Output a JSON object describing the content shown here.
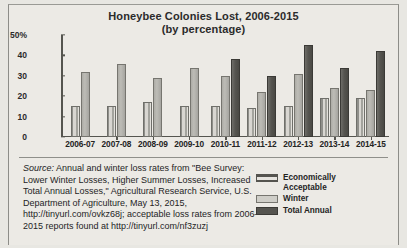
{
  "chart_data": {
    "type": "bar",
    "title": "Honeybee Colonies Lost, 2006-2015",
    "subtitle": "(by percentage)",
    "xlabel": "",
    "ylabel": "",
    "ylim": [
      0,
      50
    ],
    "yticks": [
      "50%",
      "40",
      "30",
      "20",
      "10",
      "0"
    ],
    "ytick_values": [
      50,
      40,
      30,
      20,
      10,
      0
    ],
    "grid": false,
    "legend_position": "bottom-right",
    "categories": [
      "2006-07",
      "2007-08",
      "2008-09",
      "2009-10",
      "2010-11",
      "2011-12",
      "2012-13",
      "2013-14",
      "2014-15"
    ],
    "series": [
      {
        "name": "Economically Acceptable",
        "color": "#55544f",
        "values": [
          15,
          15,
          17,
          15,
          15,
          14,
          15,
          19,
          19
        ]
      },
      {
        "name": "Winter",
        "color": "#cfcec8",
        "values": [
          32,
          36,
          29,
          34,
          30,
          22,
          31,
          24,
          23
        ]
      },
      {
        "name": "Total Annual",
        "color": "#55544f",
        "values": [
          null,
          null,
          null,
          null,
          38,
          30,
          45,
          34,
          42
        ]
      }
    ]
  },
  "legend": {
    "items": [
      {
        "label_line1": "Economically",
        "label_line2": "Acceptable",
        "swatch": "acceptable"
      },
      {
        "label_line1": "Winter",
        "label_line2": "",
        "swatch": "winter"
      },
      {
        "label_line1": "Total Annual",
        "label_line2": "",
        "swatch": "total"
      }
    ]
  },
  "caption": {
    "source_label": "Source:",
    "text": " Annual and winter loss rates from \"Bee Survey: Lower Winter Losses, Higher Summer Losses, Increased Total Annual Losses,\" Agricultural Research Service, U.S. Department of Agriculture, May 13, 2015, http://tinyurl.com/ovkz68j; acceptable loss rates from 2006–2015 reports found at http://tinyurl.com/nf3zuzj"
  }
}
